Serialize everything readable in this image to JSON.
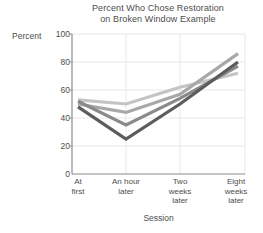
{
  "chart_data": {
    "type": "line",
    "title": "Percent Who Chose Restoration on Broken Window Example",
    "title_line1": "Percent Who Chose Restoration",
    "title_line2": "on Broken Window Example",
    "xlabel": "Session",
    "ylabel": "Percent",
    "categories": [
      "At first",
      "An hour later",
      "Two weeks later",
      "Eight weeks later"
    ],
    "category_lines": [
      [
        "At",
        "first"
      ],
      [
        "An hour",
        "later"
      ],
      [
        "Two",
        "weeks",
        "later"
      ],
      [
        "Eight",
        "weeks",
        "later"
      ]
    ],
    "ylim": [
      0,
      100
    ],
    "yticks": [
      100,
      80,
      60,
      40,
      20,
      0
    ],
    "grid": true,
    "legend": "none",
    "series": [
      {
        "name": "series-1",
        "color": "#c4c4c4",
        "values": [
          53,
          50,
          62,
          72
        ]
      },
      {
        "name": "series-2",
        "color": "#a8a8a8",
        "values": [
          50,
          44,
          57,
          86
        ]
      },
      {
        "name": "series-3",
        "color": "#8a8a8a",
        "values": [
          52,
          35,
          54,
          77
        ]
      },
      {
        "name": "series-4",
        "color": "#5c5c5c",
        "values": [
          48,
          25,
          50,
          80
        ]
      }
    ]
  },
  "axes": {
    "y_tick_labels": [
      "100",
      "80",
      "60",
      "40",
      "20",
      "0"
    ],
    "x_tick_labels": [
      "At first",
      "An hour later",
      "Two weeks later",
      "Eight weeks later"
    ]
  }
}
